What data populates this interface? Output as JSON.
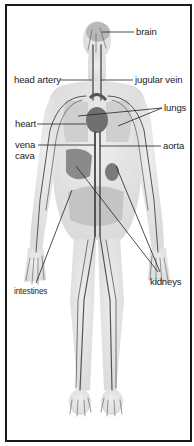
{
  "diagram": {
    "labels": [
      {
        "id": "brain",
        "text": "brain",
        "x": 136,
        "y": 27
      },
      {
        "id": "head-artery",
        "text": "head artery",
        "x": 14,
        "y": 75
      },
      {
        "id": "jugular-vein",
        "text": "jugular vein",
        "x": 135,
        "y": 75
      },
      {
        "id": "lungs",
        "text": "lungs",
        "x": 164,
        "y": 103
      },
      {
        "id": "heart",
        "text": "heart",
        "x": 15,
        "y": 119
      },
      {
        "id": "aorta",
        "text": "aorta",
        "x": 163,
        "y": 141
      },
      {
        "id": "vena-cava-line1",
        "text": "vena",
        "x": 15,
        "y": 140
      },
      {
        "id": "vena-cava-line2",
        "text": "cava",
        "x": 15,
        "y": 151
      },
      {
        "id": "kidneys",
        "text": "kidneys",
        "x": 150,
        "y": 277
      },
      {
        "id": "intestines",
        "text": "intestines",
        "x": 14,
        "y": 286
      }
    ],
    "colors": {
      "frame": "#1a1a1a",
      "body_fill": "#e6e6e6",
      "vessel": "#555555",
      "organ": "#8a8a8a",
      "leader_line": "#222222"
    }
  }
}
